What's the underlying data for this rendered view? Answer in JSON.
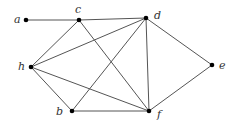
{
  "graph": {
    "nodes": [
      {
        "id": "a",
        "label": "a",
        "x": 26,
        "y": 20,
        "lx": 14,
        "ly": 23
      },
      {
        "id": "c",
        "label": "c",
        "x": 79,
        "y": 20,
        "lx": 75,
        "ly": 13
      },
      {
        "id": "d",
        "label": "d",
        "x": 146,
        "y": 18,
        "lx": 154,
        "ly": 19
      },
      {
        "id": "h",
        "label": "h",
        "x": 31,
        "y": 67,
        "lx": 18,
        "ly": 70
      },
      {
        "id": "e",
        "label": "e",
        "x": 212,
        "y": 65,
        "lx": 219,
        "ly": 69
      },
      {
        "id": "b",
        "label": "b",
        "x": 72,
        "y": 111,
        "lx": 56,
        "ly": 115
      },
      {
        "id": "f",
        "label": "f",
        "x": 149,
        "y": 111,
        "lx": 157,
        "ly": 118
      }
    ],
    "edges": [
      [
        "a",
        "c"
      ],
      [
        "c",
        "d"
      ],
      [
        "c",
        "h"
      ],
      [
        "c",
        "f"
      ],
      [
        "h",
        "d"
      ],
      [
        "h",
        "b"
      ],
      [
        "h",
        "f"
      ],
      [
        "b",
        "d"
      ],
      [
        "b",
        "f"
      ],
      [
        "d",
        "f"
      ],
      [
        "d",
        "e"
      ],
      [
        "e",
        "f"
      ]
    ]
  }
}
